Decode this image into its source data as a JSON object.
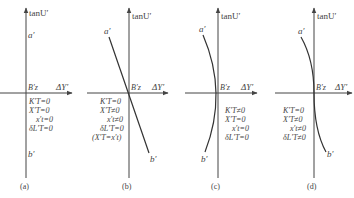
{
  "axis_labels": {
    "y": "tanU′",
    "x": "ΔY′"
  },
  "panels": [
    {
      "id": "a",
      "caption": "(a)",
      "top_label": "a′",
      "bottom_label": "b′",
      "origin_label": "B′z",
      "conditions": [
        "K′T=0",
        "X′T=0",
        "x′t=0",
        "δL′T=0"
      ],
      "curve": "vertical line"
    },
    {
      "id": "b",
      "caption": "(b)",
      "top_label": "a′",
      "bottom_label": "b′",
      "origin_label": "B′z",
      "conditions": [
        "K′T=0",
        "X′T≠0",
        "x′t≠0",
        "δL′T=0",
        "(X′T=x′t)"
      ],
      "curve": "tilted straight line"
    },
    {
      "id": "c",
      "caption": "(c)",
      "top_label": "a′",
      "bottom_label": "b′",
      "origin_label": "B′z",
      "conditions": [
        "K′T≠0",
        "X′T=0",
        "x′t=0",
        "δL′T=0"
      ],
      "curve": "symmetric arc (bow left)"
    },
    {
      "id": "d",
      "caption": "(d)",
      "top_label": "a′",
      "bottom_label": "b′",
      "origin_label": "B′z",
      "conditions": [
        "K′T=0",
        "X′T≠0",
        "x′t≠0",
        "δL′T≠0"
      ],
      "curve": "S-shaped curve"
    }
  ]
}
